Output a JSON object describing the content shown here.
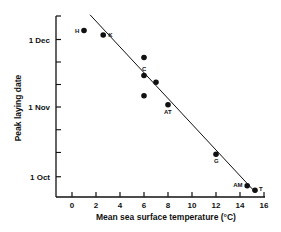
{
  "chart_data": {
    "type": "scatter",
    "title": "",
    "xlabel": "Mean sea surface temperature (°C)",
    "ylabel": "Peak laying date",
    "xlim": [
      -1,
      16
    ],
    "x_ticks": [
      0,
      2,
      4,
      6,
      8,
      10,
      12,
      14,
      16
    ],
    "y_ticks": [
      "1 Oct",
      "1 Nov",
      "1 Dec"
    ],
    "y_units": "days relative to 1 Nov",
    "y_tick_values": [
      -31,
      0,
      30
    ],
    "grid": false,
    "legend": null,
    "points": [
      {
        "label": "H",
        "x": 1.0,
        "y": 34
      },
      {
        "label": "K",
        "x": 2.6,
        "y": 32
      },
      {
        "label": "",
        "x": 6.0,
        "y": 22
      },
      {
        "label": "C",
        "x": 6.0,
        "y": 14
      },
      {
        "label": "",
        "x": 7.0,
        "y": 11
      },
      {
        "label": "",
        "x": 6.0,
        "y": 5
      },
      {
        "label": "AT",
        "x": 8.0,
        "y": 1
      },
      {
        "label": "G",
        "x": 12.0,
        "y": -21
      },
      {
        "label": "AM",
        "x": 14.6,
        "y": -35
      },
      {
        "label": "T",
        "x": 15.25,
        "y": -37
      }
    ],
    "regression_line": {
      "x_start": 1.5,
      "y_start": 41,
      "x_end": 15.3,
      "y_end": -38
    }
  }
}
